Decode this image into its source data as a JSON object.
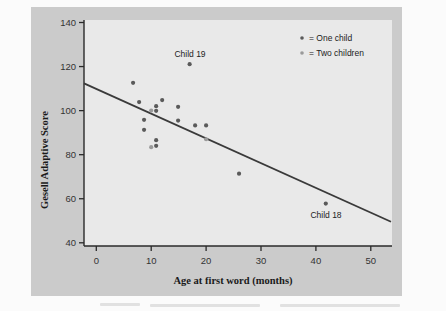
{
  "chart_data": {
    "type": "scatter",
    "title": "",
    "xlabel": "Age at first word (months)",
    "ylabel": "Gesell Adaptive Score",
    "xlim": [
      -2.2,
      53.5
    ],
    "ylim": [
      38,
      141
    ],
    "xticks": [
      0,
      10,
      20,
      30,
      40,
      50
    ],
    "yticks": [
      40,
      60,
      80,
      100,
      120,
      140
    ],
    "grid": false,
    "legend_position": "upper right",
    "legend": [
      {
        "label": "= One child",
        "marker": "dark-dot",
        "color": "#5a5a5a"
      },
      {
        "label": "= Two children",
        "marker": "light-dot",
        "color": "#9a9a9a"
      }
    ],
    "series": [
      {
        "name": "One child",
        "points": [
          {
            "x": 6.7,
            "y": 112.6
          },
          {
            "x": 7.8,
            "y": 103.9
          },
          {
            "x": 12.0,
            "y": 104.8
          },
          {
            "x": 10.9,
            "y": 102.0
          },
          {
            "x": 10.9,
            "y": 99.9
          },
          {
            "x": 8.7,
            "y": 95.8
          },
          {
            "x": 8.7,
            "y": 91.3
          },
          {
            "x": 10.9,
            "y": 86.6
          },
          {
            "x": 10.9,
            "y": 84.0
          },
          {
            "x": 17.0,
            "y": 121.1
          },
          {
            "x": 14.9,
            "y": 101.7
          },
          {
            "x": 14.9,
            "y": 95.5
          },
          {
            "x": 18.0,
            "y": 93.3
          },
          {
            "x": 20.0,
            "y": 93.3
          },
          {
            "x": 26.0,
            "y": 71.4
          },
          {
            "x": 41.8,
            "y": 57.8
          }
        ]
      },
      {
        "name": "Two children",
        "points": [
          {
            "x": 10.0,
            "y": 100.0
          },
          {
            "x": 10.0,
            "y": 83.4
          },
          {
            "x": 20.0,
            "y": 87.0
          }
        ]
      }
    ],
    "regression_line": {
      "intercept": 109.87,
      "slope": -1.127,
      "x_start": -2.2,
      "x_end": 53.5
    },
    "annotations": [
      {
        "text": "Child 19",
        "x": 17.0,
        "y": 121.1
      },
      {
        "text": "Child 18",
        "x": 41.8,
        "y": 57.8
      }
    ]
  },
  "labels": {
    "ylabel": "Gesell Adaptive Score",
    "xlabel": "Age at first word (months)",
    "legend_one": "= One child",
    "legend_two": "= Two children",
    "child19": "Child 19",
    "child18": "Child 18",
    "xticks": [
      "0",
      "10",
      "20",
      "30",
      "40",
      "50"
    ],
    "yticks": [
      "40",
      "60",
      "80",
      "100",
      "120",
      "140"
    ]
  },
  "colors": {
    "panel": "#cbcbcb",
    "plot_bg": "#e9e9e9",
    "axis": "#2a2a2a",
    "line": "#3a3a3a",
    "point_dark": "#5a5a5a",
    "point_light": "#9a9a9a"
  }
}
